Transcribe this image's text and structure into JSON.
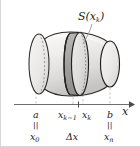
{
  "figure": {
    "type": "math-diagram",
    "background_color": "#ffffff",
    "border_color": "#cfcfcf"
  },
  "callout": {
    "label": "S(x",
    "label_sub": "k",
    "label_close": ")",
    "full_text": "S(xk)",
    "meaning": "cross-sectional-area-function",
    "leader_line": "from label down-left to slab front face"
  },
  "solid": {
    "name": "barrel-shaped-solid",
    "fill_light": "#f2f1ef",
    "fill_mid": "#e3e2e0",
    "fill_dark": "#c9c8c6",
    "outline_color": "#2b2b2b",
    "left_cap_style": "dashed-hidden-ellipse",
    "right_cap_style": "solid-visible-ellipse"
  },
  "slab": {
    "name": "cross-section-slab",
    "fill": "#a8a7a5",
    "front_face_fill": "#dddcda",
    "outline_color": "#1f1f1f",
    "description": "shaded disk slice of thickness delta-x"
  },
  "axis": {
    "name": "x-axis",
    "label": "x",
    "line_color": "#6e6e6e",
    "arrow": "right",
    "x_start": 14,
    "x_end": 132,
    "y": 104
  },
  "ticks": [
    {
      "id": "a",
      "x": 36,
      "top_label": "a",
      "sub": "",
      "eq_label": "x",
      "eq_sub": "0",
      "has_dashed_leader": true
    },
    {
      "id": "xk-1",
      "x": 73,
      "top_label": "x",
      "sub": "k−1",
      "eq_label": "",
      "eq_sub": "",
      "has_dashed_leader": true
    },
    {
      "id": "xk",
      "x": 83,
      "top_label": "x",
      "sub": "k",
      "eq_label": "",
      "eq_sub": "",
      "has_dashed_leader": true
    },
    {
      "id": "b",
      "x": 110,
      "top_label": "b",
      "sub": "",
      "eq_label": "x",
      "eq_sub": "n",
      "has_dashed_leader": true
    }
  ],
  "labels": {
    "a": "a",
    "x_0": "x",
    "x_0_sub": "0",
    "x_k_minus_1": "x",
    "x_k_minus_1_sub": "k−1",
    "x_k": "x",
    "x_k_sub": "k",
    "b": "b",
    "x_n": "x",
    "x_n_sub": "n",
    "delta_x": "Δx",
    "axis_x": "x",
    "equals_sign": "||"
  },
  "leaders": {
    "color": "#b9b9b9",
    "style": "dashed",
    "count": 4
  }
}
